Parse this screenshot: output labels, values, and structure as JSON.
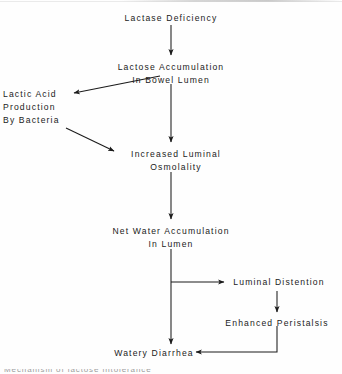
{
  "diagram": {
    "type": "flowchart",
    "background_color": "#fefefe",
    "line_color": "#1b1b1b",
    "text_color": "#1b1b1b",
    "nodes": [
      {
        "id": "lactase_deficiency",
        "lines": [
          "Lactase Deficiency"
        ]
      },
      {
        "id": "lactose_accumulation",
        "lines": [
          "Lactose Accumulation",
          "In Bowel Lumen"
        ]
      },
      {
        "id": "lactic_acid",
        "lines": [
          "Lactic Acid",
          "Production",
          "By Bacteria"
        ]
      },
      {
        "id": "increased_osmolality",
        "lines": [
          "Increased Luminal",
          "Osmolality"
        ]
      },
      {
        "id": "net_water",
        "lines": [
          "Net Water Accumulation",
          "In Lumen"
        ]
      },
      {
        "id": "luminal_distention",
        "lines": [
          "Luminal Distention"
        ]
      },
      {
        "id": "enhanced_peristalsis",
        "lines": [
          "Enhanced Peristalsis"
        ]
      },
      {
        "id": "watery_diarrhea",
        "lines": [
          "Watery Diarrhea"
        ]
      }
    ],
    "edges": [
      {
        "from": "lactase_deficiency",
        "to": "lactose_accumulation",
        "style": "vertical"
      },
      {
        "from": "lactose_accumulation",
        "to": "lactic_acid",
        "style": "diagonal"
      },
      {
        "from": "lactose_accumulation",
        "to": "increased_osmolality",
        "style": "vertical"
      },
      {
        "from": "lactic_acid",
        "to": "increased_osmolality",
        "style": "diagonal"
      },
      {
        "from": "increased_osmolality",
        "to": "net_water",
        "style": "vertical"
      },
      {
        "from": "net_water",
        "to": "luminal_distention",
        "style": "elbow-right"
      },
      {
        "from": "net_water",
        "to": "watery_diarrhea",
        "style": "vertical"
      },
      {
        "from": "luminal_distention",
        "to": "enhanced_peristalsis",
        "style": "vertical"
      },
      {
        "from": "enhanced_peristalsis",
        "to": "watery_diarrhea",
        "style": "elbow-left"
      }
    ],
    "caption_remnant": "Mechanism of lactose intolerance"
  }
}
